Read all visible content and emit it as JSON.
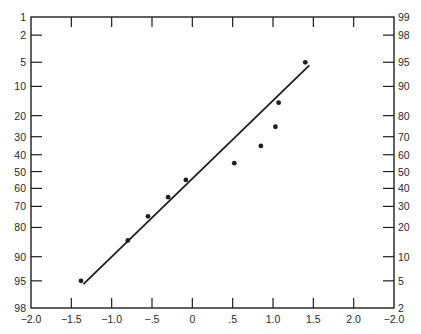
{
  "chart_data": {
    "type": "scatter",
    "title": "",
    "subtitle": "",
    "xlabel": "",
    "ylabel": "",
    "grid": false,
    "legend": null,
    "x_axis": {
      "range": [
        -2.0,
        2.5
      ],
      "tick_values": [
        -2.0,
        -1.5,
        -1.0,
        -0.5,
        0,
        0.5,
        1.0,
        1.5,
        2.0,
        2.5
      ],
      "tick_labels": [
        "−2.0",
        "−1.5",
        "−1.0",
        "−.5",
        "0",
        ".5",
        "1.0",
        "1.5",
        "2.0",
        "−2.0"
      ]
    },
    "y_axis_left": {
      "scale": "normal-probability (cumulative %)",
      "tick_labels": [
        "1",
        "2",
        "5",
        "10",
        "20",
        "30",
        "40",
        "50",
        "60",
        "70",
        "80",
        "90",
        "95",
        "98"
      ],
      "direction": "top-to-bottom increasing"
    },
    "y_axis_right": {
      "scale": "normal-probability (cumulative %)",
      "tick_labels": [
        "99",
        "98",
        "95",
        "90",
        "80",
        "70",
        "60",
        "50",
        "40",
        "30",
        "20",
        "10",
        "5",
        "2"
      ],
      "direction": "bottom-to-top increasing"
    },
    "series": [
      {
        "name": "observations",
        "kind": "points",
        "points": [
          {
            "x": -1.38,
            "y_left": 95
          },
          {
            "x": -0.8,
            "y_left": 85
          },
          {
            "x": -0.55,
            "y_left": 75
          },
          {
            "x": -0.3,
            "y_left": 65
          },
          {
            "x": -0.08,
            "y_left": 55
          },
          {
            "x": 0.52,
            "y_left": 45
          },
          {
            "x": 0.85,
            "y_left": 35
          },
          {
            "x": 1.03,
            "y_left": 25
          },
          {
            "x": 1.07,
            "y_left": 15
          },
          {
            "x": 1.4,
            "y_left": 5
          }
        ]
      },
      {
        "name": "fitted line",
        "kind": "line",
        "points": [
          {
            "x": -1.35,
            "y_left": 95.5
          },
          {
            "x": 1.45,
            "y_left": 5.5
          }
        ]
      }
    ]
  },
  "colors": {
    "ink": "#1e1e1e",
    "background": "#ffffff"
  }
}
